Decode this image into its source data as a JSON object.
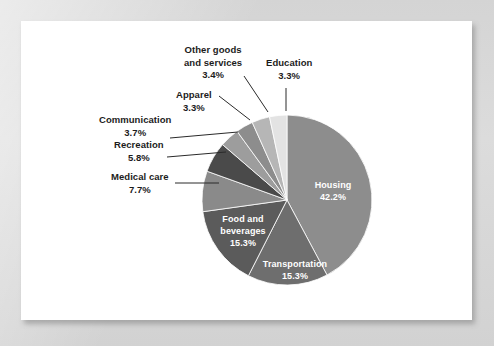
{
  "chart_data": {
    "type": "pie",
    "title": "",
    "subtitle": "",
    "legend_position": "labels",
    "grid": false,
    "categories": [
      "Housing",
      "Transportation",
      "Food and beverages",
      "Medical care",
      "Recreation",
      "Communication",
      "Apparel",
      "Other goods and services",
      "Education"
    ],
    "values": [
      42.2,
      15.3,
      15.3,
      7.7,
      5.8,
      3.7,
      3.3,
      3.4,
      3.3
    ],
    "value_labels": [
      "42.2%",
      "15.3%",
      "15.3%",
      "7.7%",
      "5.8%",
      "3.7%",
      "3.3%",
      "3.4%",
      "3.3%"
    ],
    "units": "percent",
    "start_angle_deg": 0,
    "direction": "clockwise",
    "colors": [
      "#8d8d8d",
      "#6e6e6e",
      "#5b5b5b",
      "#8a8a8a",
      "#4a4a4a",
      "#9d9d9d",
      "#8d8d8d",
      "#b6b6b6",
      "#e3e3e3"
    ]
  },
  "slices": {
    "housing": {
      "name": "Housing",
      "pct": "42.2%",
      "label_line1": "Housing",
      "label_line2": "42.2%"
    },
    "transportation": {
      "name": "Transportation",
      "pct": "15.3%",
      "label_line1": "Transportation",
      "label_line2": "15.3%"
    },
    "food": {
      "name": "Food and beverages",
      "pct": "15.3%",
      "label_line1": "Food and",
      "label_line2": "beverages",
      "label_line3": "15.3%"
    },
    "medical": {
      "name": "Medical care",
      "pct": "7.7%",
      "label_line1": "Medical care",
      "label_line2": "7.7%"
    },
    "recreation": {
      "name": "Recreation",
      "pct": "5.8%",
      "label_line1": "Recreation",
      "label_line2": "5.8%"
    },
    "communication": {
      "name": "Communication",
      "pct": "3.7%",
      "label_line1": "Communication",
      "label_line2": "3.7%"
    },
    "apparel": {
      "name": "Apparel",
      "pct": "3.3%",
      "label_line1": "Apparel",
      "label_line2": "3.3%"
    },
    "other_goods": {
      "name": "Other goods and services",
      "pct": "3.4%",
      "label_line1": "Other goods",
      "label_line2": "and services",
      "label_line3": "3.4%"
    },
    "education": {
      "name": "Education",
      "pct": "3.3%",
      "label_line1": "Education",
      "label_line2": "3.3%"
    }
  },
  "colors": {
    "page_background": "#d6d6d6",
    "card_background": "#ffffff",
    "label_text": "#1c1c1c",
    "slice_label_text": "#ffffff",
    "leader_line": "#2a2a2a"
  }
}
